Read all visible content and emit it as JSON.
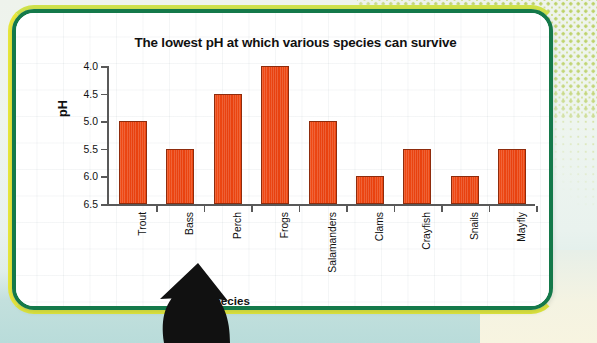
{
  "chart_data": {
    "type": "bar",
    "title": "The lowest pH at which various species can survive",
    "xlabel": "Species",
    "ylabel": "pH",
    "categories": [
      "Trout",
      "Bass",
      "Perch",
      "Frogs",
      "Salamanders",
      "Clams",
      "Crayfish",
      "Snails",
      "Mayfly"
    ],
    "values": [
      5.0,
      5.5,
      4.5,
      4.0,
      5.0,
      6.0,
      5.5,
      6.0,
      5.5
    ],
    "ylim": [
      4.0,
      6.5
    ],
    "y_axis_inverted": true,
    "yticks": [
      "4.0",
      "4.5",
      "5.0",
      "5.5",
      "6.0",
      "6.5"
    ],
    "ytick_values": [
      4.0,
      4.5,
      5.0,
      5.5,
      6.0,
      6.5
    ],
    "grid": true,
    "legend": false,
    "bar_color": "#ed4711",
    "bar_edge_color": "#8e2b0c",
    "axis_color": "#595959"
  },
  "decoration": {
    "card_border_color": "#14794a",
    "card_accent_color": "#e9e83a",
    "dot_pattern_color": "#b9cf5e",
    "background_color": "#b9dcda",
    "arrow_color": "#111111",
    "arrow_name": "up-arrow-annotation"
  }
}
